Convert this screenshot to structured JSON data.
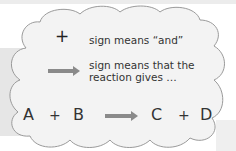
{
  "legend": {
    "plus_symbol": "+",
    "plus_meaning": "sign means “and”",
    "arrow_meaning_line1": "sign means that the",
    "arrow_meaning_line2": "reaction gives …"
  },
  "equation": {
    "reactant1": "A",
    "plus1": "+",
    "reactant2": "B",
    "product1": "C",
    "plus2": "+",
    "product2": "D"
  },
  "colors": {
    "cloud_fill": "#f2f2f2",
    "cloud_stroke": "#9a9a9a",
    "arrow": "#8a8a8a",
    "text": "#333333"
  }
}
